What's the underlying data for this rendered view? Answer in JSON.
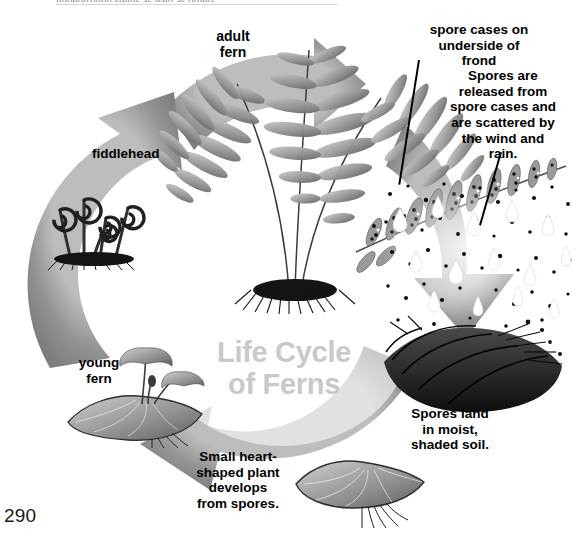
{
  "page": {
    "number": "290",
    "running_head": "underground stems as well as others"
  },
  "diagram": {
    "title_line1": "Life Cycle",
    "title_line2": "of Ferns",
    "title_color": "#c9c9c9",
    "ring_color": "#8c8c8c",
    "background_color": "#ffffff"
  },
  "labels": {
    "adult_fern": "adult\nfern",
    "adult_fern_line1": "adult",
    "adult_fern_line2": "fern",
    "spore_cases": "spore cases on underside of frond",
    "spore_cases_l1": "spore cases on",
    "spore_cases_l2": "underside of",
    "spore_cases_l3": "frond",
    "spores_released": "Spores are released from spore cases and are scattered by the wind and rain.",
    "spores_released_l1": "Spores are",
    "spores_released_l2": "released from",
    "spores_released_l3": "spore cases and",
    "spores_released_l4": "are scattered by",
    "spores_released_l5": "the wind and",
    "spores_released_l6": "rain.",
    "fiddlehead": "fiddlehead",
    "young_fern_l1": "young",
    "young_fern_l2": "fern",
    "spores_land_l1": "Spores land",
    "spores_land_l2": "in moist,",
    "spores_land_l3": "shaded soil.",
    "heart_plant_l1": "Small heart-",
    "heart_plant_l2": "shaped plant",
    "heart_plant_l3": "develops",
    "heart_plant_l4": "from spores."
  },
  "stages": [
    {
      "id": "adult-fern",
      "name": "adult fern",
      "position": "top-center"
    },
    {
      "id": "spore-cases",
      "name": "spore cases on underside of frond",
      "position": "top-right"
    },
    {
      "id": "spores-released",
      "name": "spores released and scattered",
      "position": "right"
    },
    {
      "id": "spores-land",
      "name": "spores land in moist shaded soil",
      "position": "bottom-right"
    },
    {
      "id": "heart-plant",
      "name": "small heart-shaped plant",
      "position": "bottom-center"
    },
    {
      "id": "young-fern",
      "name": "young fern",
      "position": "bottom-left"
    },
    {
      "id": "fiddlehead",
      "name": "fiddlehead",
      "position": "left"
    }
  ],
  "icons": {
    "arrow_up": "arrow-up-icon",
    "arrow_right": "arrow-right-icon",
    "arrow_down": "arrow-down-icon",
    "arrow_left": "arrow-left-icon"
  }
}
